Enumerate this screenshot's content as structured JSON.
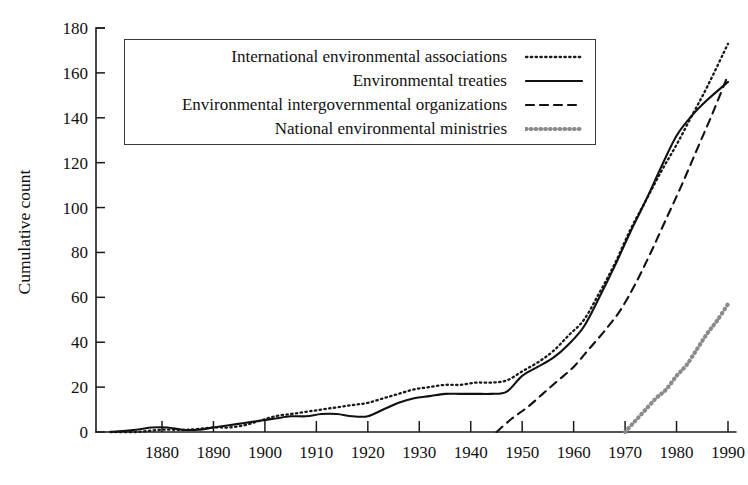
{
  "chart_data": {
    "type": "line",
    "title": "",
    "xlabel": "",
    "ylabel": "Cumulative count",
    "xlim": [
      1870,
      1992
    ],
    "ylim": [
      0,
      180
    ],
    "grid": false,
    "legend_position": "top-left-inside",
    "x_ticks": [
      1880,
      1890,
      1900,
      1910,
      1920,
      1930,
      1940,
      1950,
      1960,
      1970,
      1980,
      1990
    ],
    "y_ticks": [
      0,
      20,
      40,
      60,
      80,
      100,
      120,
      140,
      160,
      180
    ],
    "series": [
      {
        "name": "International environmental associations",
        "style": "fine-dotted",
        "color": "#1a1a1a",
        "points": [
          [
            1870,
            0
          ],
          [
            1875,
            0
          ],
          [
            1880,
            1
          ],
          [
            1885,
            1
          ],
          [
            1890,
            2
          ],
          [
            1893,
            2
          ],
          [
            1896,
            3
          ],
          [
            1899,
            5
          ],
          [
            1902,
            7
          ],
          [
            1905,
            8
          ],
          [
            1908,
            9
          ],
          [
            1911,
            10
          ],
          [
            1914,
            11
          ],
          [
            1917,
            12
          ],
          [
            1920,
            13
          ],
          [
            1923,
            15
          ],
          [
            1926,
            17
          ],
          [
            1929,
            19
          ],
          [
            1932,
            20
          ],
          [
            1935,
            21
          ],
          [
            1938,
            21
          ],
          [
            1941,
            22
          ],
          [
            1944,
            22
          ],
          [
            1947,
            23
          ],
          [
            1950,
            27
          ],
          [
            1953,
            31
          ],
          [
            1956,
            36
          ],
          [
            1959,
            43
          ],
          [
            1962,
            50
          ],
          [
            1965,
            62
          ],
          [
            1968,
            75
          ],
          [
            1971,
            90
          ],
          [
            1974,
            103
          ],
          [
            1977,
            116
          ],
          [
            1980,
            128
          ],
          [
            1983,
            141
          ],
          [
            1986,
            154
          ],
          [
            1990,
            173
          ]
        ]
      },
      {
        "name": "Environmental treaties",
        "style": "solid",
        "color": "#111111",
        "points": [
          [
            1870,
            0
          ],
          [
            1875,
            1
          ],
          [
            1878,
            2
          ],
          [
            1881,
            2
          ],
          [
            1884,
            1
          ],
          [
            1887,
            1
          ],
          [
            1890,
            2
          ],
          [
            1893,
            3
          ],
          [
            1896,
            4
          ],
          [
            1899,
            5
          ],
          [
            1902,
            6
          ],
          [
            1905,
            7
          ],
          [
            1908,
            7
          ],
          [
            1911,
            8
          ],
          [
            1914,
            8
          ],
          [
            1917,
            7
          ],
          [
            1920,
            7
          ],
          [
            1923,
            10
          ],
          [
            1926,
            13
          ],
          [
            1929,
            15
          ],
          [
            1932,
            16
          ],
          [
            1935,
            17
          ],
          [
            1938,
            17
          ],
          [
            1941,
            17
          ],
          [
            1944,
            17
          ],
          [
            1947,
            18
          ],
          [
            1950,
            25
          ],
          [
            1953,
            29
          ],
          [
            1956,
            33
          ],
          [
            1959,
            39
          ],
          [
            1962,
            47
          ],
          [
            1965,
            60
          ],
          [
            1968,
            74
          ],
          [
            1971,
            89
          ],
          [
            1974,
            103
          ],
          [
            1977,
            118
          ],
          [
            1980,
            132
          ],
          [
            1983,
            141
          ],
          [
            1986,
            148
          ],
          [
            1990,
            156
          ]
        ]
      },
      {
        "name": "Environmental intergovernmental organizations",
        "style": "dashed",
        "color": "#111111",
        "points": [
          [
            1945,
            0
          ],
          [
            1948,
            6
          ],
          [
            1951,
            11
          ],
          [
            1954,
            17
          ],
          [
            1957,
            23
          ],
          [
            1960,
            29
          ],
          [
            1963,
            37
          ],
          [
            1966,
            45
          ],
          [
            1969,
            54
          ],
          [
            1972,
            66
          ],
          [
            1975,
            80
          ],
          [
            1978,
            95
          ],
          [
            1981,
            110
          ],
          [
            1984,
            126
          ],
          [
            1987,
            142
          ],
          [
            1990,
            159
          ]
        ]
      },
      {
        "name": "National environmental ministries",
        "style": "thick-dotted",
        "color": "#8a8a8a",
        "points": [
          [
            1970,
            0
          ],
          [
            1972,
            5
          ],
          [
            1974,
            10
          ],
          [
            1976,
            15
          ],
          [
            1978,
            19
          ],
          [
            1980,
            25
          ],
          [
            1982,
            30
          ],
          [
            1984,
            37
          ],
          [
            1986,
            44
          ],
          [
            1988,
            50
          ],
          [
            1990,
            57
          ]
        ]
      }
    ]
  },
  "legend": {
    "entries": [
      {
        "label": "International environmental associations",
        "style": "fine-dotted"
      },
      {
        "label": "Environmental treaties",
        "style": "solid"
      },
      {
        "label": "Environmental intergovernmental organizations",
        "style": "dashed"
      },
      {
        "label": "National environmental ministries",
        "style": "thick-dotted"
      }
    ]
  }
}
